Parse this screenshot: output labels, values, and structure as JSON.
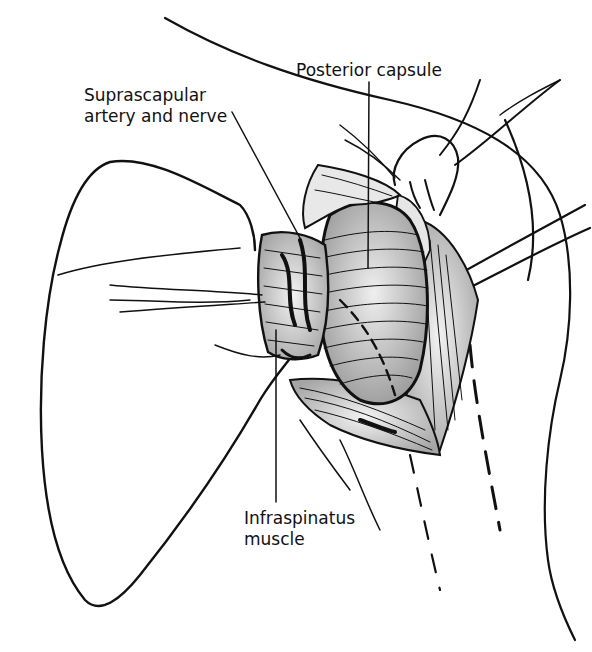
{
  "figure": {
    "type": "anatomical-illustration",
    "labels": [
      {
        "id": "posterior-capsule",
        "text": "Posterior capsule"
      },
      {
        "id": "suprascapular",
        "text": "Suprascapular\nartery and nerve"
      },
      {
        "id": "infraspinatus",
        "text": "Infraspinatus\nmuscle"
      }
    ]
  },
  "colors": {
    "ink": "#111111",
    "background": "#ffffff",
    "shade": "#d9d9d9"
  }
}
